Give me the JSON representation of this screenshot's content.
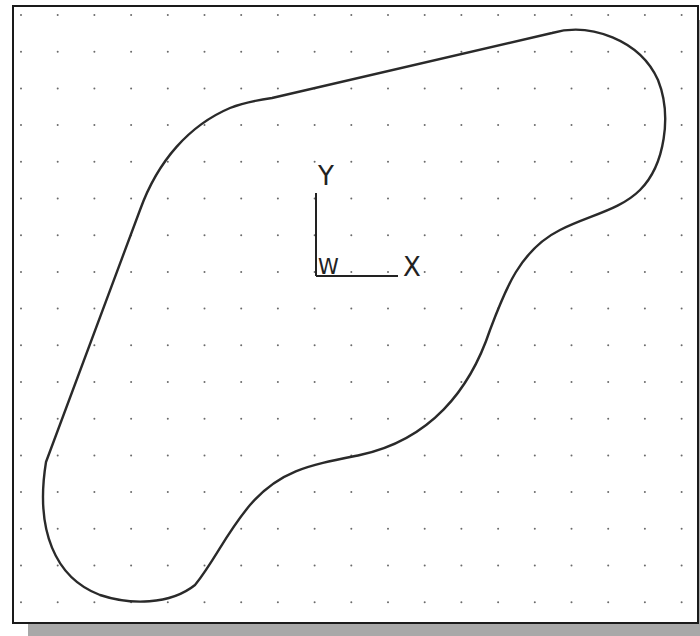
{
  "viewport": {
    "background": "#ffffff",
    "border_color": "#1a1a1a",
    "grid": {
      "visible": true,
      "spacing_px": 36.7,
      "origin_px": [
        21,
        15
      ],
      "dot_color": "#6a6a6a"
    }
  },
  "ucs_icon": {
    "y_label": "Y",
    "x_label": "X",
    "w_label": "W",
    "color": "#222222"
  },
  "profile": {
    "description": "Closed 2D sketch profile: two rounded lobes joined by a straight edge and S-shaped spline curves",
    "stroke_color": "#2a2a2a",
    "stroke_width": 2.4
  }
}
